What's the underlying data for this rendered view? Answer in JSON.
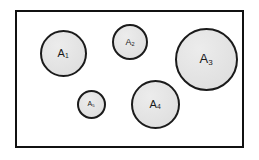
{
  "figure": {
    "background_color": "#ffffff",
    "frame": {
      "label": "universal-set-rectangle",
      "x": 15,
      "y": 10,
      "width": 229,
      "height": 138,
      "border_color": "#111111",
      "border_width": 2,
      "fill_color": "#ffffff"
    },
    "style": {
      "circle_fill": "#e3e3e3",
      "circle_stroke": "#1b1b1b",
      "label_color": "#1a1a1a"
    }
  },
  "chart_data": {
    "type": "diagram",
    "title": "",
    "subtitle": "",
    "xlabel": "",
    "ylabel": "",
    "legend": [],
    "grid": false,
    "container": {
      "shape": "rectangle",
      "x": 15,
      "y": 10,
      "width": 229,
      "height": 138
    },
    "shapes": [
      {
        "name": "circle-a1",
        "label_base": "A",
        "label_sub": "1",
        "cx": 63,
        "cy": 53,
        "diameter": 47,
        "radius": 23.5,
        "stroke_width": 2,
        "font_size": 11
      },
      {
        "name": "circle-a2",
        "label_base": "A",
        "label_sub": "2",
        "cx": 130,
        "cy": 42,
        "diameter": 36,
        "radius": 18,
        "stroke_width": 2,
        "font_size": 9
      },
      {
        "name": "circle-a3",
        "label_base": "A",
        "label_sub": "3",
        "cx": 206,
        "cy": 59,
        "diameter": 63,
        "radius": 31.5,
        "stroke_width": 2,
        "font_size": 13
      },
      {
        "name": "circle-a4",
        "label_base": "A",
        "label_sub": "4",
        "cx": 155,
        "cy": 104,
        "diameter": 49,
        "radius": 24.5,
        "stroke_width": 2,
        "font_size": 11
      },
      {
        "name": "circle-a5",
        "label_base": "A",
        "label_sub": "5",
        "cx": 91,
        "cy": 104,
        "diameter": 29,
        "radius": 14.5,
        "stroke_width": 2,
        "font_size": 7
      }
    ]
  }
}
